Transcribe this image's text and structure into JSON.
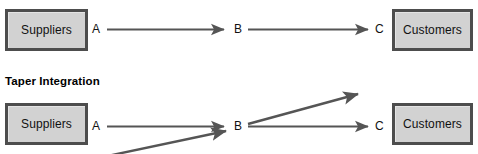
{
  "figure": {
    "background_color": "#ffffff",
    "line_color": "#555555",
    "box_fill_color": "#d2d2d2",
    "box_border_color": "#4d4d4d"
  },
  "sections": [
    {
      "id": "top-flow",
      "title": "",
      "entities": {
        "left_box_label": "Suppliers",
        "right_box_label": "Customers"
      },
      "nodes": [
        {
          "id": "a",
          "label": "A"
        },
        {
          "id": "b",
          "label": "B"
        },
        {
          "id": "c",
          "label": "C"
        }
      ],
      "arrows": [
        {
          "from": "A",
          "to": "B",
          "direction": "right",
          "style": "straight"
        },
        {
          "from": "B",
          "to": "C",
          "direction": "right",
          "style": "straight"
        }
      ]
    },
    {
      "id": "taper-flow",
      "title": "Taper Integration",
      "entities": {
        "left_box_label": "Suppliers",
        "right_box_label": "Customers"
      },
      "nodes": [
        {
          "id": "a",
          "label": "A"
        },
        {
          "id": "b",
          "label": "B"
        },
        {
          "id": "c",
          "label": "C"
        }
      ],
      "arrows": [
        {
          "from": "A",
          "to": "B",
          "direction": "right",
          "style": "straight"
        },
        {
          "from": "B",
          "to": "C",
          "direction": "right",
          "style": "straight"
        },
        {
          "from": "B",
          "to": "upper-right-external",
          "direction": "up-right",
          "style": "diagonal"
        },
        {
          "from": "lower-left-external",
          "to": "B",
          "direction": "up-right",
          "style": "diagonal"
        }
      ]
    }
  ]
}
